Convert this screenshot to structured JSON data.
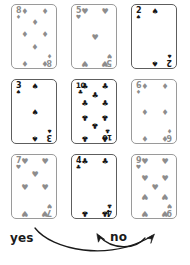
{
  "figure": {
    "background_color": "#ffffff",
    "black_suit_color": "#161616",
    "red_suit_color": "#8d8d8d",
    "card_border_color": "#9a9a9a"
  },
  "cards": [
    {
      "rank": "8",
      "suit": "diamonds",
      "suit_glyph": "♦",
      "color_class": "red",
      "count": 8
    },
    {
      "rank": "5",
      "suit": "hearts",
      "suit_glyph": "♥",
      "color_class": "red",
      "count": 5
    },
    {
      "rank": "2",
      "suit": "spades",
      "suit_glyph": "♠",
      "color_class": "blk",
      "count": 2
    },
    {
      "rank": "3",
      "suit": "spades",
      "suit_glyph": "♠",
      "color_class": "blk",
      "count": 3
    },
    {
      "rank": "10",
      "suit": "clubs",
      "suit_glyph": "♣",
      "color_class": "blk",
      "count": 10
    },
    {
      "rank": "6",
      "suit": "diamonds",
      "suit_glyph": "♦",
      "color_class": "red",
      "count": 6
    },
    {
      "rank": "7",
      "suit": "hearts",
      "suit_glyph": "♥",
      "color_class": "red",
      "count": 7
    },
    {
      "rank": "4",
      "suit": "clubs",
      "suit_glyph": "♣",
      "color_class": "blk",
      "count": 4
    },
    {
      "rank": "9",
      "suit": "hearts",
      "suit_glyph": "♥",
      "color_class": "red",
      "count": 9
    }
  ],
  "annotations": {
    "yes_label": "yes",
    "no_label": "no",
    "yes_arrow_target": "9-of-hearts",
    "no_arrow_target": "4-of-clubs"
  }
}
